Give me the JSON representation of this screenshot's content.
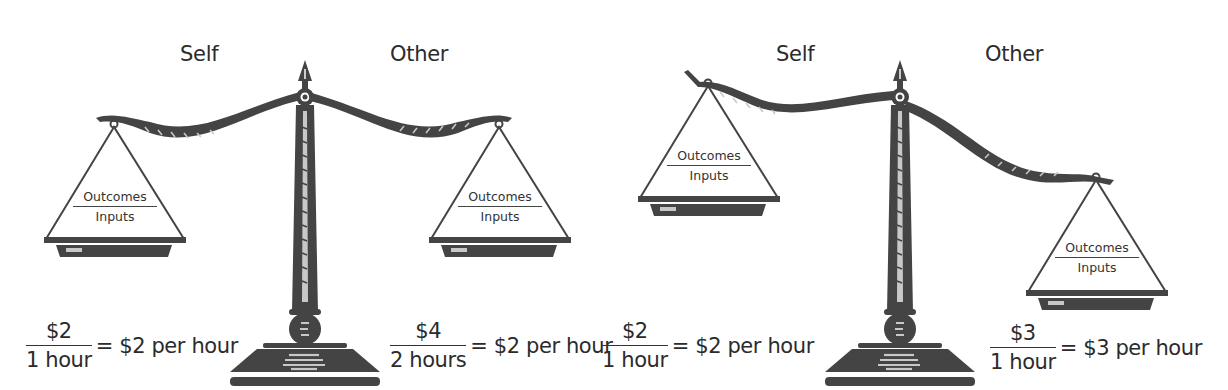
{
  "figure": {
    "left_scale": {
      "state": "balanced",
      "labels": {
        "self": "Self",
        "other": "Other"
      },
      "pans": {
        "self": {
          "numerator": "Outcomes",
          "denominator": "Inputs"
        },
        "other": {
          "numerator": "Outcomes",
          "denominator": "Inputs"
        }
      },
      "equations": {
        "self": {
          "numerator": "$2",
          "denominator": "1 hour",
          "result": "= $2 per hour"
        },
        "other": {
          "numerator": "$4",
          "denominator": "2 hours",
          "result": "= $2 per hour"
        }
      }
    },
    "right_scale": {
      "state": "unbalanced",
      "labels": {
        "self": "Self",
        "other": "Other"
      },
      "pans": {
        "self": {
          "numerator": "Outcomes",
          "denominator": "Inputs"
        },
        "other": {
          "numerator": "Outcomes",
          "denominator": "Inputs"
        }
      },
      "equations": {
        "self": {
          "numerator": "$2",
          "denominator": "1 hour",
          "result": "= $2 per hour"
        },
        "other": {
          "numerator": "$3",
          "denominator": "1 hour",
          "result": "= $3 per hour"
        }
      }
    }
  },
  "colors": {
    "ink": "#444444",
    "highlight": "#bdbdbd",
    "text": "#2b2b2b",
    "background": "#ffffff"
  }
}
